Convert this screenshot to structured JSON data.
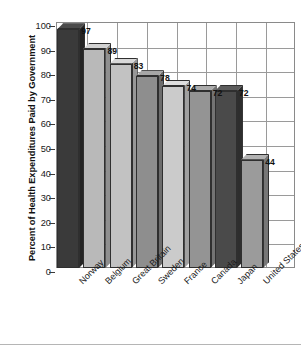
{
  "chart_data": {
    "type": "bar",
    "title": "",
    "subtitle": "",
    "xlabel": "",
    "ylabel": "Percent of Health Expenditures Paid by Government",
    "ylim": [
      0,
      100
    ],
    "yticks": [
      0,
      10,
      20,
      30,
      40,
      50,
      60,
      70,
      80,
      90,
      100
    ],
    "ytick_labels": [
      "0",
      "10",
      "20",
      "30",
      "40",
      "50",
      "60",
      "70",
      "80",
      "90",
      "100"
    ],
    "grid": true,
    "legend": "none",
    "categories": [
      "Norway",
      "Belgium",
      "Great Britain",
      "Sweden",
      "France",
      "Canada",
      "Japan",
      "United States"
    ],
    "values": [
      97,
      89,
      83,
      78,
      74,
      72,
      72,
      44
    ],
    "value_labels": [
      "97",
      "89",
      "83",
      "78",
      "74",
      "72",
      "72",
      "44"
    ],
    "bar_colors": [
      "#3a3a3a",
      "#b9b9b9",
      "#c2c2c2",
      "#8e8e8e",
      "#cbcbcb",
      "#949494",
      "#4a4a4a",
      "#9b9b9b"
    ],
    "bar_side_colors": [
      "#242424",
      "#8f8f8f",
      "#979797",
      "#6c6c6c",
      "#a0a0a0",
      "#737373",
      "#2e2e2e",
      "#777777"
    ],
    "bar_top_colors": [
      "#4b4b4b",
      "#d2d2d2",
      "#d8d8d8",
      "#a6a6a6",
      "#dedede",
      "#ababab",
      "#5c5c5c",
      "#b2b2b2"
    ],
    "axis_color": "#8a8a8a",
    "grid_color": "#9a9a9a",
    "text_color": "#111111",
    "background": "#ffffff"
  }
}
